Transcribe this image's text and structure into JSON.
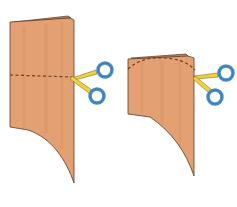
{
  "illustration": {
    "description": "Two steps of cutting folded paper with scissors",
    "colors": {
      "paper": "#e3a173",
      "paper_shade": "#d48c5e",
      "paper_fold": "#c97f52",
      "outline": "#5a3a2a",
      "dash": "#6b3e22",
      "scissor_blade": "#f2d23a",
      "scissor_handle": "#4a8fcc",
      "scissor_handle_dark": "#2e6aa3"
    },
    "steps": [
      {
        "label": "step-1-straight-cut",
        "cut_line": "straight-dashed"
      },
      {
        "label": "step-2-curved-cut",
        "cut_line": "curved-dashed"
      }
    ]
  }
}
